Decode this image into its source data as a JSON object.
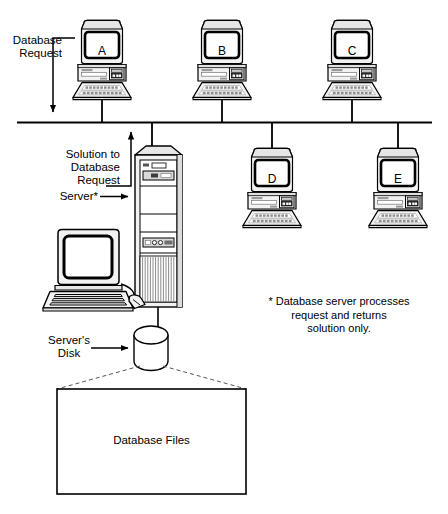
{
  "diagram": {
    "background_color": "#ffffff",
    "line_color": "#000000",
    "fill_light": "#f2f2f2",
    "fill_mid": "#d9d9d9",
    "fill_dark": "#4d4d4d"
  },
  "labels": {
    "database_request": "Database\nRequest",
    "solution_to_database_request": "Solution to\nDatabase\nRequest",
    "server": "Server*",
    "servers_disk": "Server's\nDisk",
    "database_files": "Database Files",
    "footnote": "* Database server processes\nrequest and returns\nsolution only."
  },
  "workstations": [
    {
      "id": "A",
      "screen_label": "A"
    },
    {
      "id": "B",
      "screen_label": "B"
    },
    {
      "id": "C",
      "screen_label": "C"
    },
    {
      "id": "D",
      "screen_label": "D"
    },
    {
      "id": "E",
      "screen_label": "E"
    }
  ],
  "nodes": {
    "server_tower": "Server*",
    "server_console": "Server console workstation",
    "disk": "Server's Disk",
    "files_box": "Database Files"
  }
}
